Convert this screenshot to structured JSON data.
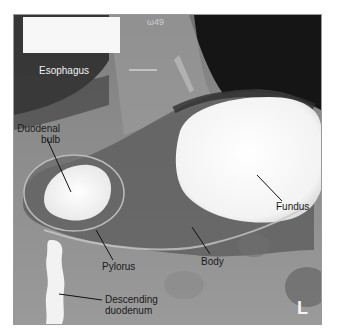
{
  "figure": {
    "type": "barium-swallow-radiograph",
    "orientation_marker": "L",
    "corner_id_text": "ω49",
    "labels": [
      {
        "id": "esophagus",
        "text": "Esophagus"
      },
      {
        "id": "duodenal-bulb",
        "line1": "Duodenal",
        "line2": "bulb"
      },
      {
        "id": "fundus",
        "text": "Fundus"
      },
      {
        "id": "pylorus",
        "text": "Pylorus"
      },
      {
        "id": "body",
        "text": "Body"
      },
      {
        "id": "descending-duodenum",
        "line1": "Descending",
        "line2": "duodenum"
      }
    ]
  },
  "colors": {
    "barium": "#f8f8f8",
    "soft_tissue": "#8a8a8a",
    "air": "#111111",
    "frame_border": "#9a9a9a"
  }
}
